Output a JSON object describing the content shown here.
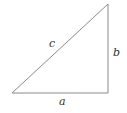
{
  "diagram": {
    "type": "right-triangle",
    "stroke_color": "#8a8a8a",
    "label_color": "#333333",
    "vertices": {
      "bottom_left": [
        12,
        93
      ],
      "bottom_right": [
        108,
        93
      ],
      "top_right": [
        108,
        4
      ]
    },
    "labels": {
      "hypotenuse": "c",
      "vertical_leg": "b",
      "horizontal_leg": "a"
    }
  }
}
